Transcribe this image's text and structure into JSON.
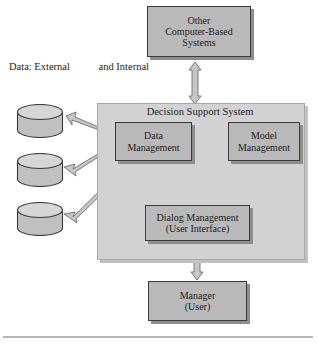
{
  "diagram": {
    "panel": {
      "label": "Decision Support System"
    },
    "side_label": {
      "line1": "Data:  External",
      "line2": "and Internal"
    },
    "nodes": {
      "other_systems": {
        "line1": "Other",
        "line2": "Computer-Based",
        "line3": "Systems"
      },
      "data_management": {
        "line1": "Data",
        "line2": "Management"
      },
      "model_management": {
        "line1": "Model",
        "line2": "Management"
      },
      "dialog_management": {
        "line1": "Dialog Management",
        "line2": "(User Interface)"
      },
      "manager": {
        "line1": "Manager",
        "line2": "(User)"
      }
    },
    "databases": [
      {
        "name": "database-cylinder-1"
      },
      {
        "name": "database-cylinder-2"
      },
      {
        "name": "database-cylinder-3"
      }
    ],
    "connectors": [
      {
        "from": "other_systems",
        "to": "decision_support_system",
        "arrow": "double",
        "orientation": "vertical"
      },
      {
        "from": "data_management",
        "to": "model_management",
        "arrow": "double",
        "orientation": "horizontal"
      },
      {
        "from": "data_management",
        "to": "dialog_management",
        "arrow": "single",
        "orientation": "diagonal"
      },
      {
        "from": "model_management",
        "to": "dialog_management",
        "arrow": "single",
        "orientation": "diagonal"
      },
      {
        "from": "dialog_management",
        "to": "manager",
        "arrow": "double",
        "orientation": "vertical"
      },
      {
        "from": "data_management",
        "to": "database-cylinder-1",
        "arrow": "double",
        "orientation": "diagonal"
      },
      {
        "from": "data_management",
        "to": "database-cylinder-2",
        "arrow": "double",
        "orientation": "diagonal"
      },
      {
        "from": "data_management",
        "to": "database-cylinder-3",
        "arrow": "double",
        "orientation": "diagonal"
      }
    ],
    "colors": {
      "node_fill": "#b9b9b9",
      "node_border": "#3a3a3a",
      "panel_fill": "#d2d2d2",
      "panel_border": "#a8a8a8",
      "arrow_fill": "#c6c6c6",
      "arrow_border": "#6d6d6d",
      "shadow": "#8e8e8e",
      "text": "#1c1c1c",
      "background": "#ffffff"
    }
  }
}
